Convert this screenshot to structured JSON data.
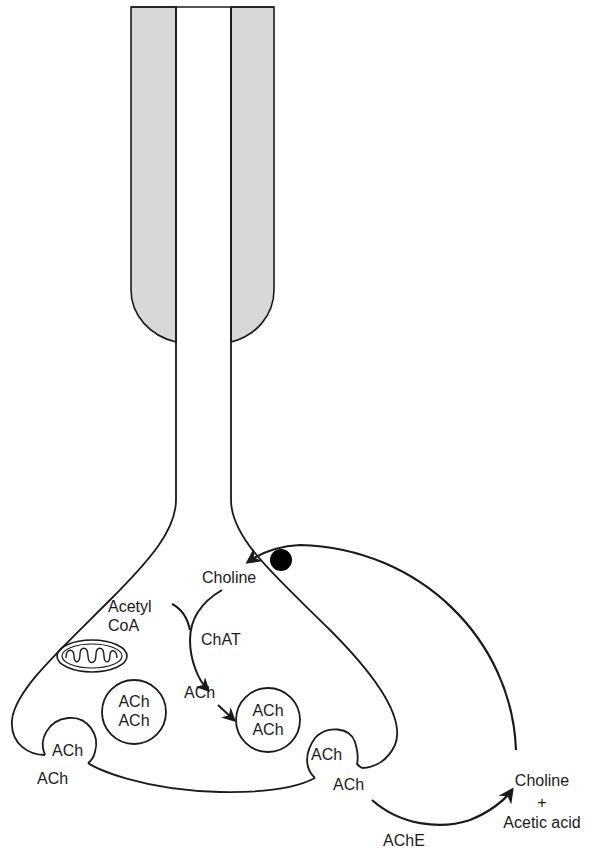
{
  "diagram": {
    "colors": {
      "myelin_fill": "#d8d8d8",
      "stroke": "#1a1a1a",
      "background": "#ffffff",
      "transporter": "#000000"
    },
    "labels": {
      "choline_inside": "Choline",
      "acetyl": "Acetyl",
      "coa": "CoA",
      "chat": "ChAT",
      "ach_synth": "ACh",
      "vesicle_left_1": "ACh",
      "vesicle_left_2": "ACh",
      "vesicle_mid_1": "ACh",
      "vesicle_mid_2": "ACh",
      "release_left_vesicle": "ACh",
      "release_left_out": "ACh",
      "release_right_vesicle": "ACh",
      "release_right_out": "ACh",
      "ache": "AChE",
      "choline_out": "Choline",
      "plus": "+",
      "acetic_acid": "Acetic acid"
    },
    "components": [
      "myelin-sheath",
      "axon",
      "nerve-terminal",
      "mitochondrion",
      "synaptic-vesicles",
      "choline-transporter"
    ]
  }
}
